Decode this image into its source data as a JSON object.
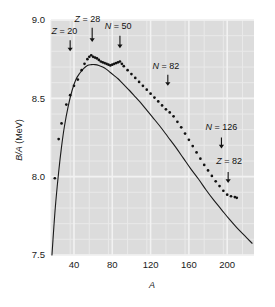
{
  "figure": {
    "background_color": "#ffffff",
    "plot_background_color": "#dcdcdc",
    "gridline_color": "#f2f2f2",
    "curve_color": "#1a1a1a",
    "point_color": "#111111"
  },
  "chart_data": {
    "type": "line",
    "title": "",
    "subtitle": "",
    "xlabel": "A",
    "ylabel": "B/A (MeV)",
    "xlim": [
      16,
      228
    ],
    "ylim": [
      7.5,
      9.0
    ],
    "xticks": [
      40,
      80,
      120,
      160,
      200
    ],
    "xticklabels": [
      "40",
      "80",
      "120",
      "160",
      "200"
    ],
    "yticks": [
      7.5,
      8.0,
      8.5,
      9.0
    ],
    "yticklabels": [
      "7.5",
      "8.0",
      "8.5",
      "9.0"
    ],
    "grid": true,
    "grid_minor_x_step": 20,
    "grid_minor_y_step": 0.1,
    "legend": null,
    "legend_position": "none",
    "series": [
      {
        "name": "Semi-empirical mass formula (smooth curve)",
        "style": "line",
        "x": [
          17,
          19,
          21,
          24,
          27,
          30,
          34,
          38,
          42,
          46,
          50,
          54,
          58,
          62,
          66,
          70,
          74,
          78,
          82,
          86,
          90,
          94,
          98,
          104,
          110,
          116,
          122,
          130,
          138,
          146,
          154,
          162,
          170,
          178,
          186,
          194,
          202,
          210,
          218,
          226
        ],
        "y": [
          7.5,
          7.68,
          7.84,
          8.03,
          8.19,
          8.32,
          8.45,
          8.55,
          8.62,
          8.66,
          8.69,
          8.71,
          8.715,
          8.715,
          8.71,
          8.7,
          8.685,
          8.665,
          8.645,
          8.625,
          8.6,
          8.575,
          8.55,
          8.51,
          8.47,
          8.425,
          8.38,
          8.32,
          8.255,
          8.19,
          8.12,
          8.05,
          7.985,
          7.915,
          7.85,
          7.79,
          7.73,
          7.675,
          7.625,
          7.575
        ]
      },
      {
        "name": "Measured nuclei (data points)",
        "style": "points",
        "x": [
          20,
          24,
          27,
          32,
          36,
          40,
          44,
          48,
          51,
          54,
          56,
          58,
          60,
          62,
          64,
          66,
          68,
          70,
          72,
          74,
          76,
          78,
          80,
          82,
          84,
          86,
          88,
          90,
          92,
          96,
          100,
          104,
          108,
          112,
          116,
          120,
          124,
          128,
          132,
          136,
          140,
          144,
          148,
          152,
          156,
          160,
          164,
          168,
          172,
          176,
          180,
          184,
          188,
          192,
          196,
          200,
          204,
          208,
          210
        ],
        "y": [
          7.99,
          8.24,
          8.34,
          8.46,
          8.52,
          8.58,
          8.62,
          8.68,
          8.72,
          8.75,
          8.765,
          8.775,
          8.765,
          8.76,
          8.755,
          8.745,
          8.735,
          8.73,
          8.725,
          8.72,
          8.715,
          8.71,
          8.715,
          8.72,
          8.725,
          8.73,
          8.735,
          8.72,
          8.705,
          8.68,
          8.655,
          8.63,
          8.605,
          8.58,
          8.555,
          8.53,
          8.505,
          8.48,
          8.455,
          8.43,
          8.41,
          8.385,
          8.35,
          8.315,
          8.275,
          8.235,
          8.195,
          8.155,
          8.115,
          8.075,
          8.04,
          8.005,
          7.97,
          7.94,
          7.91,
          7.885,
          7.875,
          7.87,
          7.865
        ]
      }
    ],
    "annotations": [
      {
        "id": "z20",
        "label": "Z = 20",
        "symbol": "Z",
        "value": "20",
        "arrow_x": 36,
        "arrow_y_top": 8.87,
        "arrow_y_tip": 8.8,
        "label_x": 30,
        "label_y": 8.91,
        "anchor": "middle"
      },
      {
        "id": "z28",
        "label": "Z = 28",
        "symbol": "Z",
        "value": "28",
        "arrow_x": 59,
        "arrow_y_top": 8.95,
        "arrow_y_tip": 8.86,
        "label_x": 54,
        "label_y": 8.985,
        "anchor": "middle"
      },
      {
        "id": "n50",
        "label": "N = 50",
        "symbol": "N",
        "value": "50",
        "arrow_x": 88,
        "arrow_y_top": 8.9,
        "arrow_y_tip": 8.82,
        "label_x": 86,
        "label_y": 8.94,
        "anchor": "middle"
      },
      {
        "id": "n82",
        "label": "N = 82",
        "symbol": "N",
        "value": "82",
        "arrow_x": 138,
        "arrow_y_top": 8.65,
        "arrow_y_tip": 8.58,
        "label_x": 136,
        "label_y": 8.69,
        "anchor": "middle"
      },
      {
        "id": "n126",
        "label": "N = 126",
        "symbol": "N",
        "value": "126",
        "arrow_x": 194,
        "arrow_y_top": 8.25,
        "arrow_y_tip": 8.18,
        "label_x": 194,
        "label_y": 8.3,
        "anchor": "middle"
      },
      {
        "id": "z82",
        "label": "Z = 82",
        "symbol": "Z",
        "value": "82",
        "arrow_x": 201,
        "arrow_y_top": 8.03,
        "arrow_y_tip": 7.96,
        "label_x": 202,
        "label_y": 8.08,
        "anchor": "middle"
      }
    ]
  }
}
